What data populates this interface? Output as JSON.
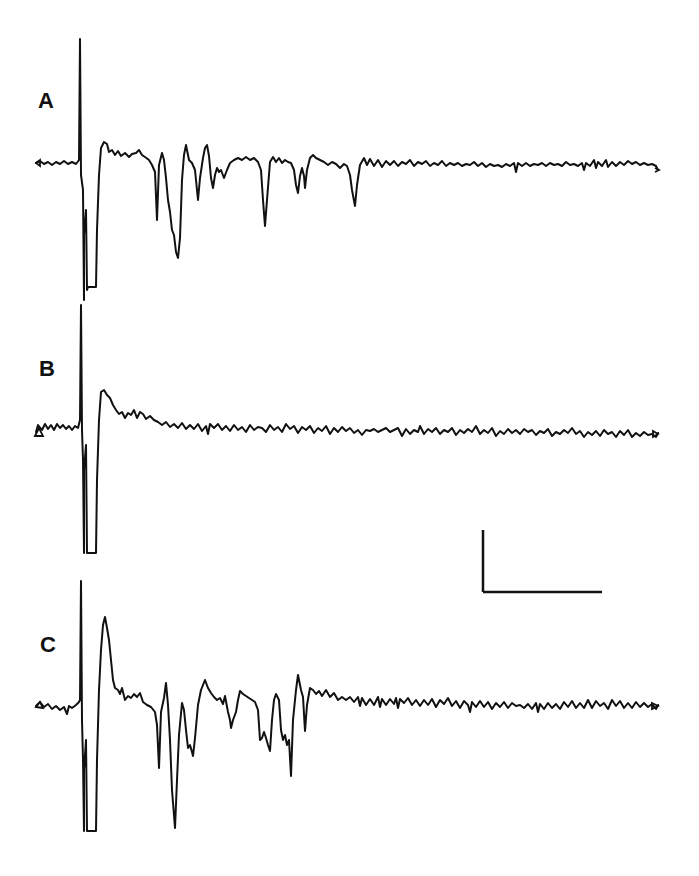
{
  "figure": {
    "panels": [
      {
        "id": "A",
        "label": "A",
        "label_pos": [
          38,
          90
        ],
        "baseline_y": 163
      },
      {
        "id": "B",
        "label": "B",
        "label_pos": [
          39,
          358
        ],
        "baseline_y": 430
      },
      {
        "id": "C",
        "label": "C",
        "label_pos": [
          40,
          634
        ],
        "baseline_y": 706
      }
    ],
    "scale_bar": {
      "vertical": {
        "x": 483,
        "y1": 530,
        "y2": 592
      },
      "horizontal": {
        "x1": 483,
        "x2": 602,
        "y": 592
      },
      "labels": []
    }
  },
  "chart_data": {
    "type": "line",
    "title": "",
    "xlabel": "",
    "ylabel": "",
    "grid": false,
    "legend": [],
    "series": [
      {
        "name": "A",
        "baseline_px": 163,
        "stimulus_artifact": {
          "x": 80,
          "top": 39,
          "bottom": 287
        },
        "events_px": [
          {
            "x": 90,
            "y": 287,
            "kind": "clipped-negative"
          },
          {
            "x": 104,
            "y": 142,
            "kind": "positive-peak"
          },
          {
            "x": 157,
            "y": 220,
            "kind": "negative-spike"
          },
          {
            "x": 162,
            "y": 153,
            "kind": "positive"
          },
          {
            "x": 178,
            "y": 258,
            "kind": "negative-spike"
          },
          {
            "x": 186,
            "y": 145,
            "kind": "positive"
          },
          {
            "x": 198,
            "y": 200,
            "kind": "negative-spike"
          },
          {
            "x": 207,
            "y": 145,
            "kind": "positive"
          },
          {
            "x": 213,
            "y": 188,
            "kind": "negative"
          },
          {
            "x": 265,
            "y": 226,
            "kind": "negative-spike"
          },
          {
            "x": 298,
            "y": 193,
            "kind": "negative"
          },
          {
            "x": 305,
            "y": 188,
            "kind": "negative"
          },
          {
            "x": 355,
            "y": 206,
            "kind": "negative-spike"
          }
        ],
        "end_x": 658
      },
      {
        "name": "B",
        "baseline_px": 430,
        "stimulus_artifact": {
          "x": 81,
          "top": 305,
          "bottom": 553
        },
        "events_px": [
          {
            "x": 92,
            "y": 553,
            "kind": "clipped-negative"
          },
          {
            "x": 104,
            "y": 390,
            "kind": "positive-peak"
          }
        ],
        "end_x": 658
      },
      {
        "name": "C",
        "baseline_px": 706,
        "stimulus_artifact": {
          "x": 81,
          "top": 581,
          "bottom": 831
        },
        "events_px": [
          {
            "x": 92,
            "y": 831,
            "kind": "clipped-negative"
          },
          {
            "x": 105,
            "y": 617,
            "kind": "positive-peak"
          },
          {
            "x": 159,
            "y": 768,
            "kind": "negative-spike"
          },
          {
            "x": 166,
            "y": 683,
            "kind": "positive"
          },
          {
            "x": 175,
            "y": 828,
            "kind": "negative-spike"
          },
          {
            "x": 182,
            "y": 703,
            "kind": "positive"
          },
          {
            "x": 193,
            "y": 756,
            "kind": "negative"
          },
          {
            "x": 205,
            "y": 680,
            "kind": "positive"
          },
          {
            "x": 231,
            "y": 728,
            "kind": "negative"
          },
          {
            "x": 240,
            "y": 691,
            "kind": "positive"
          },
          {
            "x": 260,
            "y": 740,
            "kind": "negative"
          },
          {
            "x": 270,
            "y": 751,
            "kind": "negative-spike"
          },
          {
            "x": 276,
            "y": 694,
            "kind": "positive"
          },
          {
            "x": 291,
            "y": 776,
            "kind": "negative-spike"
          },
          {
            "x": 298,
            "y": 675,
            "kind": "positive"
          },
          {
            "x": 305,
            "y": 731,
            "kind": "negative"
          }
        ],
        "end_x": 658
      }
    ],
    "scale_bar": {
      "vertical_px": 62,
      "horizontal_px": 119,
      "units": "unlabeled"
    }
  },
  "paths": {
    "A": "M36,163 L40,161 L44,164 L48,162 L52,165 L56,162 L60,164 L64,161 L68,164 L72,162 L76,164 L79,160 L80,39 L81,175 L83,190 L84,300 L84,235 L86,210 L87,290 L88,287 L96,287 L97,230 L99,175 L101,148 L104,142 L107,144 L109,152 L112,150 L115,155 L118,151 L121,156 L125,153 L129,157 L132,154 L136,153 L139,150 L142,155 L145,157 L149,160 L152,165 L155,172 L157,220 L159,165 L162,153 L164,160 L166,178 L168,200 L170,212 L172,230 L174,235 L176,252 L178,258 L180,238 L182,180 L184,155 L186,145 L189,160 L192,163 L195,170 L198,200 L200,178 L203,158 L205,148 L207,145 L209,156 L211,178 L213,188 L215,175 L217,168 L219,172 L221,170 L224,178 L227,170 L230,163 L234,160 L238,158 L242,160 L246,157 L250,160 L254,158 L258,162 L261,170 L263,200 L265,226 L267,200 L270,162 L273,157 L276,162 L279,158 L282,163 L285,160 L288,162 L291,163 L294,170 L296,185 L298,193 L300,176 L302,168 L304,176 L305,188 L307,170 L310,158 L313,155 L316,158 L320,160 L324,162 L328,165 L332,162 L336,164 L340,168 L344,164 L347,166 L350,175 L352,190 L355,206 L357,185 L360,165 L364,158 L367,165 L370,159 L374,166 L378,160 L382,167 L386,161 L390,165 L394,161 L398,166 L402,162 L406,164 L410,160 L414,166 L418,162 L422,164 L426,161 L430,166 L434,163 L438,165 L442,161 L446,166 L450,163 L454,165 L458,163 L462,166 L466,164 L470,165 L474,162 L478,166 L482,163 L486,167 L490,164 L494,166 L498,165 L502,167 L506,164 L510,166 L514,163 L516,172 L518,163 L522,166 L526,163 L530,166 L534,164 L538,165 L542,163 L546,166 L550,163 L554,165 L558,164 L562,166 L566,162 L570,165 L574,164 L578,166 L582,163 L584,170 L586,163 L590,166 L594,160 L596,168 L598,162 L602,166 L606,160 L608,167 L612,162 L616,166 L620,162 L624,165 L628,161 L632,164 L636,162 L640,165 L644,163 L648,165 L652,164 L656,166 L658,170",
    "B": "M36,432 L38,425 L42,430 L45,424 L48,429 L51,425 L54,430 L57,424 L60,428 L63,425 L66,429 L69,426 L72,430 L75,426 L78,428 L80,420 L81,305 L82,430 L83,460 L84,553 L84,470 L86,445 L87,553 L88,553 L96,553 L97,480 L99,420 L101,392 L104,390 L107,395 L110,398 L113,405 L116,410 L119,414 L122,412 L125,418 L128,413 L131,415 L134,410 L137,418 L140,412 L143,414 L146,419 L150,416 L154,420 L158,422 L162,425 L166,422 L170,427 L174,424 L178,428 L182,423 L186,429 L190,425 L194,429 L198,424 L202,431 L206,426 L208,434 L210,424 L214,428 L218,424 L222,430 L226,426 L230,431 L234,425 L238,430 L242,427 L246,432 L250,425 L254,430 L258,427 L262,428 L266,432 L270,425 L274,430 L278,427 L282,432 L286,424 L290,429 L294,426 L298,433 L302,427 L306,430 L310,426 L314,433 L318,428 L322,431 L326,426 L330,434 L334,428 L338,432 L342,427 L346,431 L350,428 L354,433 L358,430 L362,435 L366,430 L370,431 L374,429 L378,432 L382,430 L386,428 L390,432 L394,430 L398,428 L402,436 L406,429 L410,434 L414,430 L418,432 L420,426 L424,434 L428,429 L432,432 L436,428 L440,434 L444,430 L448,432 L452,428 L456,435 L460,430 L464,433 L468,429 L472,432 L476,426 L480,434 L484,430 L488,433 L492,428 L496,436 L500,431 L504,434 L508,429 L512,433 L516,430 L520,434 L524,429 L528,432 L532,430 L536,435 L540,431 L544,433 L548,429 L552,436 L556,432 L560,434 L564,430 L568,433 L572,428 L576,434 L580,431 L584,437 L588,432 L592,435 L596,431 L600,436 L604,430 L608,434 L612,432 L616,437 L620,431 L624,435 L628,430 L632,437 L636,433 L640,436 L644,432 L648,435 L652,434 L656,437 L658,433",
    "C": "M36,706 L40,702 L44,707 L48,704 L52,709 L56,706 L60,710 L64,707 L67,714 L69,706 L72,708 L76,705 L79,702 L80,700 L81,581 L82,720 L83,760 L84,831 L84,770 L86,740 L87,831 L88,831 L96,831 L97,760 L99,690 L101,650 L103,625 L105,617 L107,628 L109,640 L111,660 L113,680 L115,688 L118,690 L120,694 L122,688 L125,700 L128,696 L131,698 L134,694 L137,697 L140,693 L143,702 L147,705 L151,707 L155,712 L157,725 L159,768 L161,712 L164,698 L166,683 L168,705 L170,740 L172,790 L175,828 L177,780 L179,735 L182,703 L184,710 L186,730 L188,748 L190,745 L192,752 L193,756 L195,738 L198,705 L201,690 L205,680 L208,688 L211,693 L214,697 L217,700 L220,698 L223,704 L225,696 L228,712 L230,720 L231,728 L233,720 L236,712 L238,700 L240,691 L243,694 L246,696 L249,698 L252,700 L255,702 L258,710 L260,740 L262,738 L264,732 L266,738 L268,745 L270,751 L272,720 L274,700 L276,694 L279,700 L281,730 L283,740 L285,735 L287,745 L289,740 L291,776 L293,720 L296,690 L298,675 L301,690 L303,697 L305,731 L307,705 L310,688 L313,690 L316,694 L319,691 L322,696 L326,690 L330,697 L334,693 L338,700 L342,697 L346,700 L350,697 L354,702 L358,697 L360,706 L362,698 L366,705 L370,699 L374,705 L378,697 L380,707 L382,699 L386,705 L390,699 L394,704 L396,698 L398,708 L400,699 L404,703 L408,698 L412,705 L416,700 L420,706 L424,700 L428,705 L432,699 L436,707 L440,700 L444,704 L448,698 L452,706 L456,701 L460,708 L464,701 L468,705 L470,712 L472,702 L476,707 L480,701 L484,707 L488,702 L492,709 L496,703 L500,707 L504,702 L508,708 L512,703 L516,706 L520,705 L524,708 L528,704 L532,709 L536,703 L538,712 L540,704 L544,709 L548,703 L552,708 L556,704 L560,709 L564,702 L568,707 L572,701 L576,708 L580,703 L584,708 L588,700 L592,708 L596,701 L600,706 L604,703 L608,709 L612,700 L616,706 L620,701 L624,708 L628,703 L632,708 L636,702 L640,707 L644,703 L648,707 L652,704 L656,709 L658,705"
  },
  "markers": {
    "A_start": "M36,163 L40,160 L40,166 Z",
    "B_start": "M35,436 L39,428 L43,436 Z",
    "C_start": "M36,707 L40,702 L43,708 Z",
    "A_end": "M655,168 L659,170 L655,172",
    "B_end": "M653,431 L658,434 L653,437 Z",
    "C_end": "M652,703 L658,706 L652,709 Z"
  }
}
